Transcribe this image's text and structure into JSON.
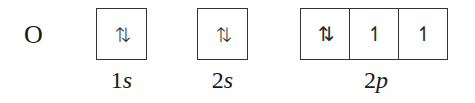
{
  "element": {
    "symbol": "O"
  },
  "orbitals": [
    {
      "label_num": "1",
      "label_sub": "s",
      "cells": [
        "⇅"
      ]
    },
    {
      "label_num": "2",
      "label_sub": "s",
      "cells": [
        "⇅"
      ]
    },
    {
      "label_num": "2",
      "label_sub": "p",
      "cells": [
        "⇅",
        "↿",
        "↿"
      ]
    }
  ]
}
